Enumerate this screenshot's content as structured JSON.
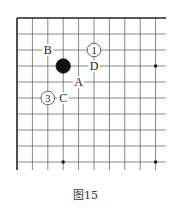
{
  "diagram": {
    "type": "go-board-fragment",
    "grid": {
      "origin_x": 17,
      "origin_y": 18,
      "spacing_x": 15.4,
      "spacing_y": 16,
      "cols": 10,
      "rows": 10,
      "extend_right": 166,
      "extend_bottom": 170,
      "line_color": "#555555",
      "edge_color": "#222222"
    },
    "star_points": [
      {
        "col": 9,
        "row": 3
      },
      {
        "col": 3,
        "row": 9
      },
      {
        "col": 9,
        "row": 9
      }
    ],
    "stones": [
      {
        "color": "black",
        "col": 3,
        "row": 3
      }
    ],
    "numbered_stones": [
      {
        "color": "white",
        "label": "1",
        "col": 5,
        "row": 2
      },
      {
        "color": "white",
        "label": "3",
        "col": 2,
        "row": 5
      }
    ],
    "letter_marks": [
      {
        "label": "B",
        "col": 2,
        "row": 2
      },
      {
        "label": "D",
        "col": 5,
        "row": 3
      },
      {
        "label": "A",
        "col": 4,
        "row": 4
      },
      {
        "label": "C",
        "col": 3,
        "row": 5
      }
    ]
  },
  "caption": "图15"
}
